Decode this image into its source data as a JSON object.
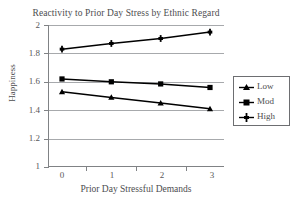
{
  "chart_data": {
    "type": "line",
    "title": "Reactivity to Prior Day Stress by Ethnic Regard",
    "xlabel": "Prior Day Stressful Demands",
    "ylabel": "Happiness",
    "categories": [
      "0",
      "1",
      "2",
      "3"
    ],
    "x": [
      0,
      1,
      2,
      3
    ],
    "xlim": [
      -0.35,
      3.35
    ],
    "ylim": [
      1,
      2
    ],
    "yticks": [
      "1",
      "1.2",
      "1.4",
      "1.6",
      "1.8",
      "2"
    ],
    "ytick_values": [
      1,
      1.2,
      1.4,
      1.6,
      1.8,
      2
    ],
    "grid": "horizontal",
    "legend_position": "right",
    "series": [
      {
        "name": "Low",
        "marker": "triangle",
        "values": [
          1.53,
          1.49,
          1.45,
          1.41
        ]
      },
      {
        "name": "Mod",
        "marker": "square",
        "values": [
          1.62,
          1.6,
          1.585,
          1.56
        ]
      },
      {
        "name": "High",
        "marker": "plus",
        "values": [
          1.83,
          1.87,
          1.905,
          1.95
        ]
      }
    ],
    "colors": {
      "line": "#000000",
      "grid": "#a7a9ac",
      "axis": "#808285",
      "text": "#4d4d4f",
      "background": "#ffffff"
    }
  },
  "legend": {
    "items": [
      {
        "label": "Low"
      },
      {
        "label": "Mod"
      },
      {
        "label": "High"
      }
    ]
  }
}
